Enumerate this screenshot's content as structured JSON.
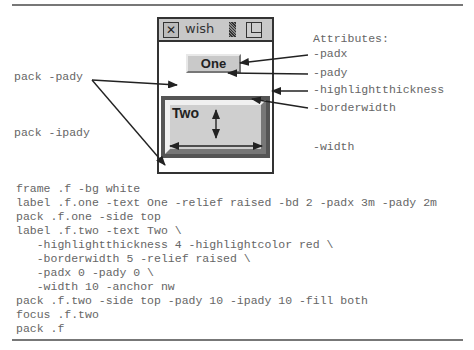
{
  "window": {
    "title": "wish",
    "close_icon": "close-box-icon",
    "resize_icon": "grip-icon",
    "zoom_icon": "zoom-box-icon"
  },
  "widgets": {
    "one_label": "One",
    "two_label": "Two"
  },
  "annotations": {
    "heading": "Attributes:",
    "right": [
      "-padx",
      "-pady",
      "-highlightthickness",
      "-borderwidth",
      "-width"
    ],
    "left": [
      "pack -pady",
      "pack -ipady"
    ]
  },
  "code": [
    "frame .f -bg white",
    "label .f.one -text One -relief raised -bd 2 -padx 3m -pady 2m",
    "pack .f.one -side top",
    "label .f.two -text Two \\",
    "   -highlightthickness 4 -highlightcolor red \\",
    "   -borderwidth 5 -relief raised \\",
    "   -padx 0 -pady 0 \\",
    "   -width 10 -anchor nw",
    "pack .f.two -side top -pady 10 -ipady 10 -fill both",
    "focus .f.two",
    "pack .f"
  ],
  "colors": {
    "frame_border": "#333333",
    "label_bg": "#cfcfcf",
    "highlight": "#555555",
    "text": "#666666"
  }
}
